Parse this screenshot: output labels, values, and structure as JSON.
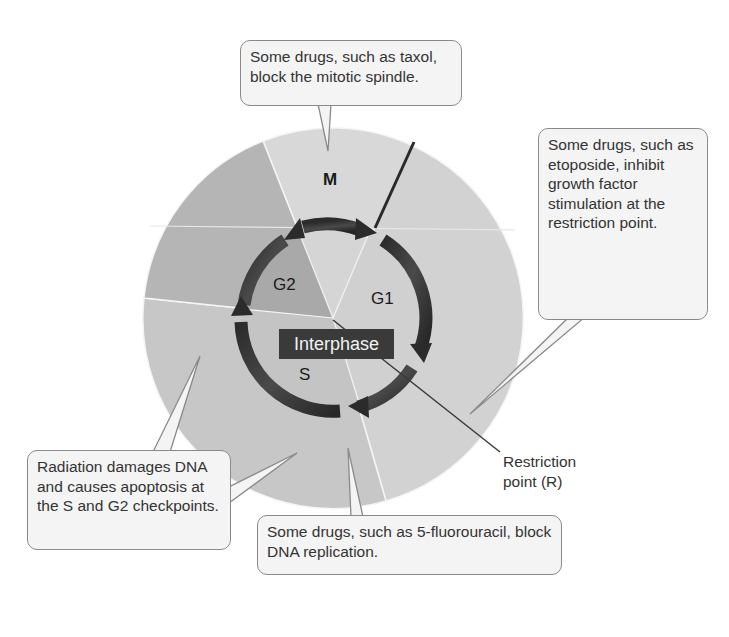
{
  "diagram": {
    "type": "cell-cycle-wheel",
    "phases": [
      {
        "id": "M",
        "label": "M"
      },
      {
        "id": "G1",
        "label": "G1"
      },
      {
        "id": "S",
        "label": "S"
      },
      {
        "id": "G2",
        "label": "G2"
      }
    ],
    "center_label": "Interphase",
    "restriction_point_label_line1": "Restriction",
    "restriction_point_label_line2": "point (R)",
    "colors": {
      "m_sector": "#d6d6d6",
      "g1_sector": "#d3d3d3",
      "s_sector": "#c6c6c6",
      "g2_sector": "#b3b3b3",
      "arrow": "#2e2e2e",
      "interphase_bg": "#3a3a3a"
    }
  },
  "callouts": {
    "taxol": "Some drugs, such as taxol, block the mitotic spindle.",
    "etoposide": "Some drugs, such as etoposide, inhibit growth factor stimulation at the restriction point.",
    "radiation": "Radiation damages DNA and causes apoptosis at the S and G2 checkpoints.",
    "fluorouracil": "Some drugs, such as 5-fluorouracil, block DNA replication."
  }
}
